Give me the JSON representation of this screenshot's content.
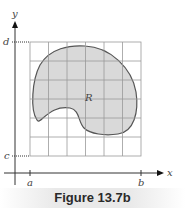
{
  "figure": {
    "caption": "Figure 13.7b",
    "axes": {
      "x_label": "x",
      "y_label": "y",
      "x_ticks": [
        "a",
        "b"
      ],
      "y_ticks": [
        "c",
        "d"
      ]
    },
    "region_label": "R",
    "grid": {
      "columns": 6,
      "rows": 6
    },
    "colors": {
      "region_fill": "#d9d9d9",
      "region_stroke": "#555555",
      "grid_line": "#999999",
      "axis": "#333333",
      "caption_bg": "#e9e9e9"
    }
  }
}
